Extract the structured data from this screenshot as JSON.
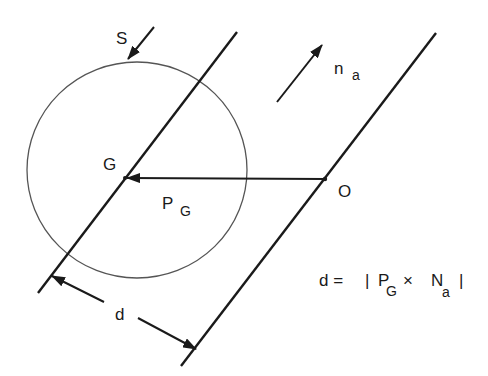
{
  "diagram": {
    "colors": {
      "stroke": "#1a1a1a",
      "circle": "#555555",
      "background": "#ffffff"
    },
    "labels": {
      "S": "S",
      "n": "n",
      "n_sub": "a",
      "G": "G",
      "O": "O",
      "P": "P",
      "P_sub": "G",
      "d": "d"
    },
    "formula": {
      "lhs": "d =",
      "bar_open": "|",
      "P": "P",
      "P_sub": "G",
      "times": "×",
      "N": "N",
      "N_sub": "a",
      "bar_close": "|"
    },
    "elements": [
      "circle",
      "axis-line-through-G",
      "axis-line-through-O",
      "vector-P_G-from-O-to-G",
      "direction-arrow-n_a",
      "arrow-S",
      "distance-dimension-d"
    ]
  }
}
